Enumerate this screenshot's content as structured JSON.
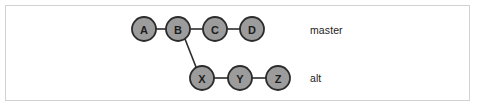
{
  "figure": {
    "kind": "git-branch-diagram",
    "background_color": "#ffffff",
    "border_color": "#d2d2d2",
    "node_fill": "#9c9c9c",
    "node_stroke": "#2b2b2b",
    "edge_color": "#2b2b2b",
    "text_color": "#1c1c1c"
  },
  "nodes": [
    {
      "id": "A",
      "label": "A",
      "cx": 144,
      "cy": 29,
      "r": 12,
      "row": "master"
    },
    {
      "id": "B",
      "label": "B",
      "cx": 178,
      "cy": 29,
      "r": 12,
      "row": "master"
    },
    {
      "id": "C",
      "label": "C",
      "cx": 215,
      "cy": 29,
      "r": 12,
      "row": "master"
    },
    {
      "id": "D",
      "label": "D",
      "cx": 252,
      "cy": 29,
      "r": 12,
      "row": "master"
    },
    {
      "id": "X",
      "label": "X",
      "cx": 202,
      "cy": 78,
      "r": 12,
      "row": "alt"
    },
    {
      "id": "Y",
      "label": "Y",
      "cx": 240,
      "cy": 78,
      "r": 12,
      "row": "alt"
    },
    {
      "id": "Z",
      "label": "Z",
      "cx": 278,
      "cy": 78,
      "r": 12,
      "row": "alt"
    }
  ],
  "edges": [
    {
      "from": "A",
      "to": "B",
      "x1": 156,
      "y1": 29,
      "x2": 166,
      "y2": 29
    },
    {
      "from": "B",
      "to": "C",
      "x1": 190,
      "y1": 29,
      "x2": 203,
      "y2": 29
    },
    {
      "from": "C",
      "to": "D",
      "x1": 227,
      "y1": 29,
      "x2": 240,
      "y2": 29
    },
    {
      "from": "B",
      "to": "X",
      "x1": 185,
      "y1": 39,
      "x2": 196,
      "y2": 67
    },
    {
      "from": "X",
      "to": "Y",
      "x1": 214,
      "y1": 78,
      "x2": 228,
      "y2": 78
    },
    {
      "from": "Y",
      "to": "Z",
      "x1": 252,
      "y1": 78,
      "x2": 266,
      "y2": 78
    }
  ],
  "branch_labels": {
    "master": "master",
    "alt": "alt"
  }
}
